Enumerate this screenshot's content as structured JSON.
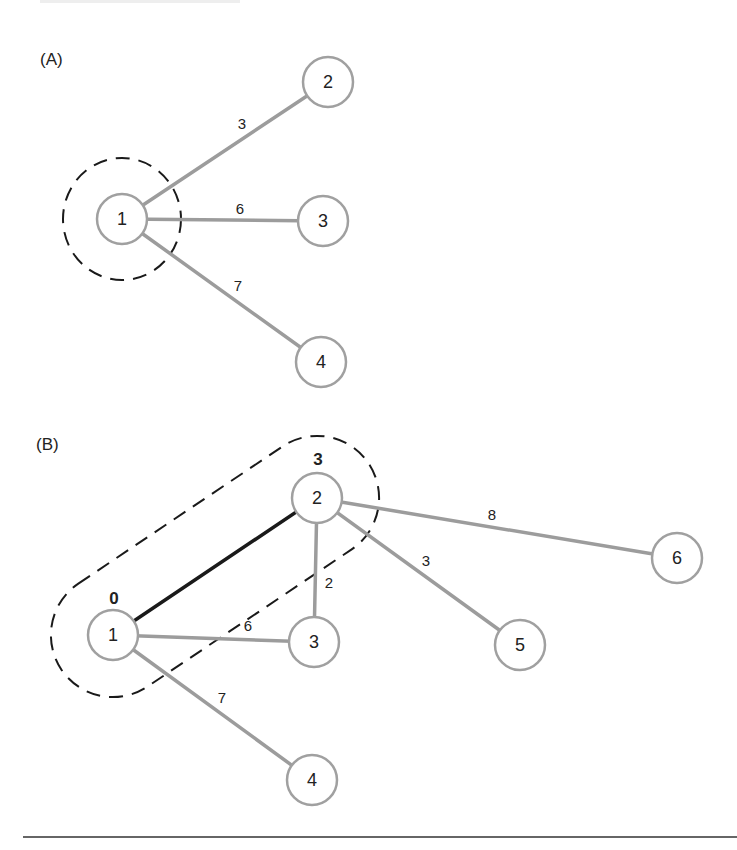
{
  "figure": {
    "panels": [
      {
        "id": "A",
        "label": "(A)",
        "nodes": [
          {
            "id": "1",
            "label": "1",
            "x": 122,
            "y": 219
          },
          {
            "id": "2",
            "label": "2",
            "x": 328,
            "y": 82
          },
          {
            "id": "3",
            "label": "3",
            "x": 323,
            "y": 221
          },
          {
            "id": "4",
            "label": "4",
            "x": 321,
            "y": 362
          }
        ],
        "edges": [
          {
            "from": "1",
            "to": "2",
            "weight": "3",
            "label_x": 242,
            "label_y": 123,
            "highlighted": false
          },
          {
            "from": "1",
            "to": "3",
            "weight": "6",
            "label_x": 240,
            "label_y": 208,
            "highlighted": false
          },
          {
            "from": "1",
            "to": "4",
            "weight": "7",
            "label_x": 238,
            "label_y": 285,
            "highlighted": false
          }
        ],
        "visited_region": {
          "shape": "circle",
          "around": [
            "1"
          ]
        }
      },
      {
        "id": "B",
        "label": "(B)",
        "nodes": [
          {
            "id": "1",
            "label": "1",
            "x": 113,
            "y": 635,
            "distance": "0"
          },
          {
            "id": "2",
            "label": "2",
            "x": 317,
            "y": 498,
            "distance": "3"
          },
          {
            "id": "3",
            "label": "3",
            "x": 314,
            "y": 642
          },
          {
            "id": "4",
            "label": "4",
            "x": 312,
            "y": 780
          },
          {
            "id": "5",
            "label": "5",
            "x": 520,
            "y": 645
          },
          {
            "id": "6",
            "label": "6",
            "x": 677,
            "y": 558
          }
        ],
        "edges": [
          {
            "from": "1",
            "to": "2",
            "weight": "",
            "highlighted": true
          },
          {
            "from": "1",
            "to": "3",
            "weight": "6",
            "label_x": 248,
            "label_y": 625,
            "highlighted": false
          },
          {
            "from": "1",
            "to": "4",
            "weight": "7",
            "label_x": 222,
            "label_y": 697,
            "highlighted": false
          },
          {
            "from": "2",
            "to": "3",
            "weight": "2",
            "label_x": 329,
            "label_y": 582,
            "highlighted": false
          },
          {
            "from": "2",
            "to": "5",
            "weight": "3",
            "label_x": 426,
            "label_y": 560,
            "highlighted": false
          },
          {
            "from": "2",
            "to": "6",
            "weight": "8",
            "label_x": 492,
            "label_y": 514,
            "highlighted": false
          }
        ],
        "visited_region": {
          "shape": "capsule",
          "around": [
            "1",
            "2"
          ]
        }
      }
    ],
    "colors": {
      "node_stroke": "#a0a0a0",
      "edge": "#9c9c9c",
      "highlighted_edge": "#1a1a1a",
      "dashed_region": "#1a1a1a"
    }
  }
}
